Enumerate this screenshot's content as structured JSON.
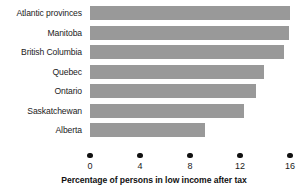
{
  "chart_data": {
    "type": "bar",
    "orientation": "horizontal",
    "title": "",
    "xlabel": "Percentage of persons in low income after tax",
    "ylabel": "",
    "categories": [
      "Atlantic provinces",
      "Manitoba",
      "British Columbia",
      "Quebec",
      "Ontario",
      "Saskatchewan",
      "Alberta"
    ],
    "values": [
      16.0,
      15.9,
      15.5,
      13.9,
      13.3,
      12.3,
      9.2
    ],
    "xlim": [
      0,
      16
    ],
    "xticks": [
      0,
      4,
      8,
      12,
      16
    ],
    "xtick_labels": [
      "0",
      "4",
      "8",
      "12",
      "16"
    ],
    "grid": false,
    "legend": false,
    "bar_color": "#999999",
    "tick_color": "#111111",
    "text_color": "#1a1a1a"
  }
}
